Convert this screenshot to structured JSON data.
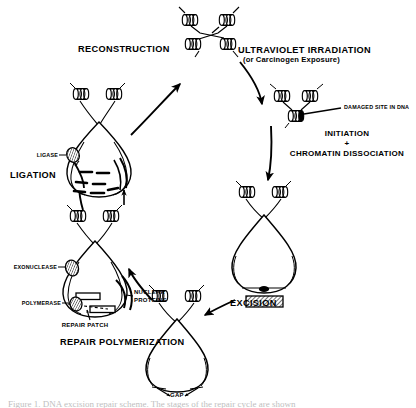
{
  "figure": {
    "background_color": "#ffffff",
    "ink_color": "#000000",
    "caption_partial": "Figure 1. DNA excision repair scheme. The stages of the repair cycle are shown"
  },
  "stages": {
    "reconstruction": "RECONSTRUCTION",
    "ultraviolet_irradiation": "ULTRAVIOLET IRRADIATION",
    "carcinogen_exposure": "(or Carcinogen Exposure)",
    "damaged_site": "DAMAGED SITE IN DNA",
    "initiation": "INITIATION",
    "plus_sign": "+",
    "chromatin_dissociation": "CHROMATIN DISSOCIATION",
    "excision": "EXCISION",
    "gap": "GAP",
    "repair_polymerization": "REPAIR POLYMERIZATION",
    "ligation": "LIGATION"
  },
  "enzymes": {
    "ligase": "LIGASE",
    "exonuclease": "EXONUCLEASE",
    "polymerase": "POLYMERASE",
    "repair_patch": "REPAIR PATCH",
    "nuclear_proteins_line1": "NUCLEAR",
    "nuclear_proteins_line2": "PROTEINS"
  },
  "diagram_elements": {
    "nucleosome_cluster_top": 4,
    "nucleosome_pair_damaged": 3,
    "nucleosome_pair_ligation": 2,
    "nucleosome_pair_excision": 2,
    "nucleosome_pair_gap": 2,
    "nucleosome_pair_repair": 2,
    "excised_fragment": "hatched-rectangle",
    "cycle_direction": "clockwise"
  }
}
